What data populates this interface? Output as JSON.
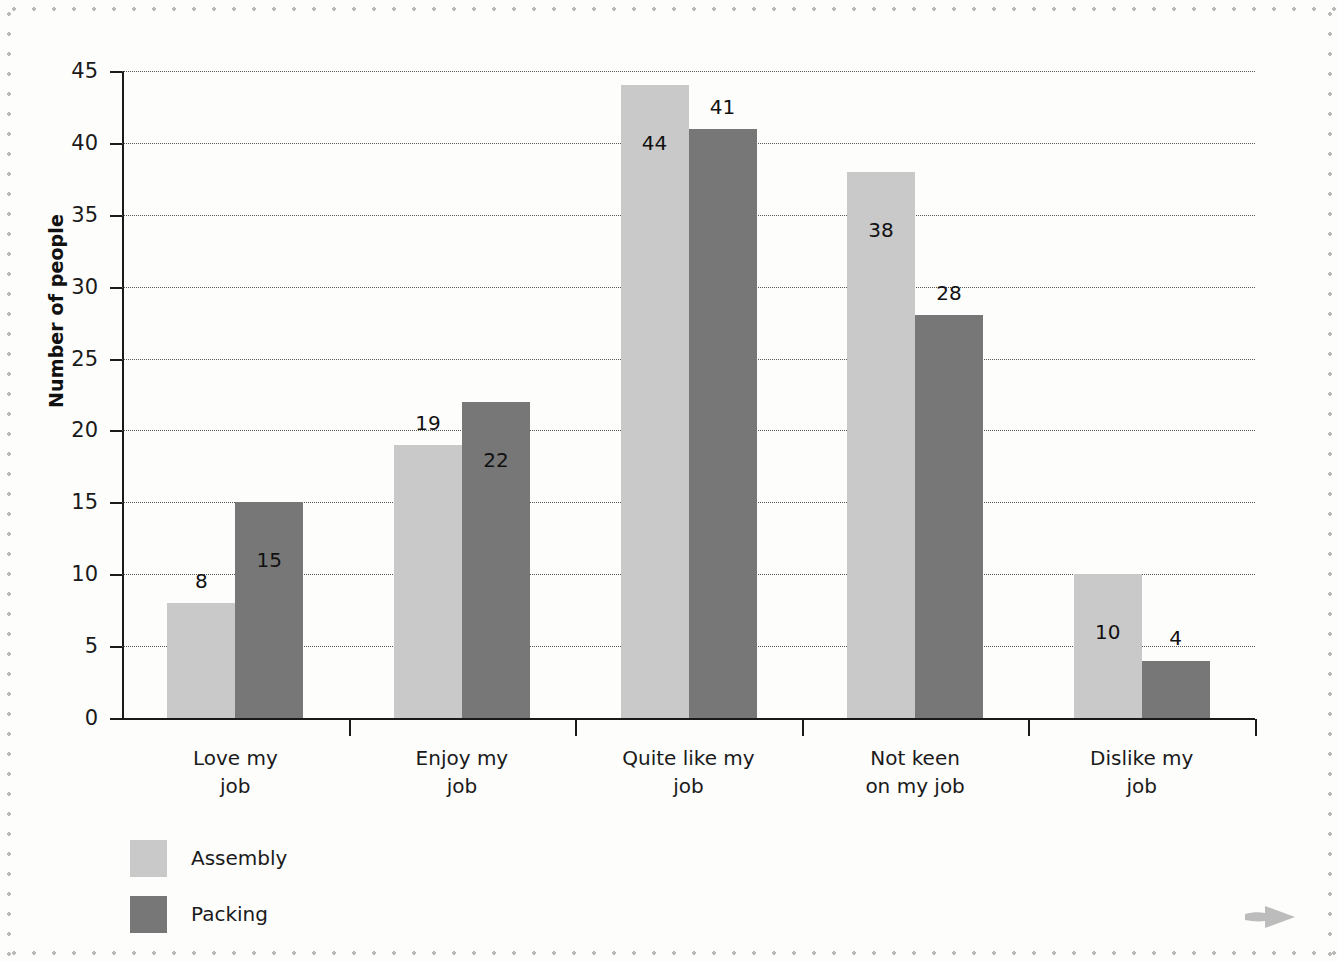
{
  "chart_data": {
    "type": "bar",
    "title": "",
    "xlabel": "",
    "ylabel": "Number of people",
    "ylim": [
      0,
      45
    ],
    "ytick_step": 5,
    "yticks": [
      0,
      5,
      10,
      15,
      20,
      25,
      30,
      35,
      40,
      45
    ],
    "grid": true,
    "legend_position": "bottom-left",
    "categories": [
      "Love my\njob",
      "Enjoy my\njob",
      "Quite like my\njob",
      "Not keen\non my job",
      "Dislike my\njob"
    ],
    "series": [
      {
        "name": "Assembly",
        "color": "#c9c9c9",
        "values": [
          8,
          19,
          44,
          38,
          10
        ]
      },
      {
        "name": "Packing",
        "color": "#777777",
        "values": [
          15,
          22,
          41,
          28,
          4
        ]
      }
    ],
    "value_labels": {
      "Assembly": [
        "8",
        "19",
        "44",
        "38",
        "10"
      ],
      "Packing": [
        "15",
        "22",
        "41",
        "28",
        "4"
      ]
    }
  },
  "legend": {
    "items": [
      {
        "label": "Assembly",
        "color": "#c9c9c9"
      },
      {
        "label": "Packing",
        "color": "#777777"
      }
    ]
  },
  "icons": {
    "corner_arrow": "right-arrow-icon"
  },
  "colors": {
    "assembly": "#c9c9c9",
    "packing": "#777777",
    "axis": "#1a1a1a",
    "grid": "#555555",
    "page_background": "#fdfdfc",
    "border_dots": "#b9b9b9"
  }
}
